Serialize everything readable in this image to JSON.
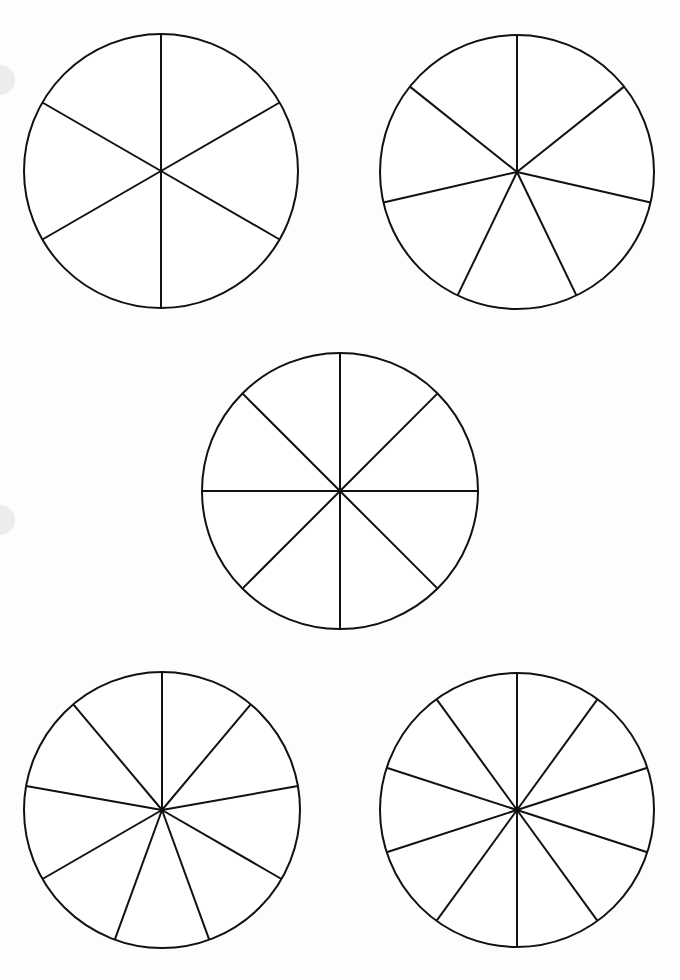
{
  "page": {
    "background": "#fdfdfd",
    "stroke_color": "#111111",
    "stroke_width": 2
  },
  "punch_holes": [
    {
      "x": 0,
      "y": 80,
      "r": 15
    },
    {
      "x": 0,
      "y": 520,
      "r": 15
    }
  ],
  "circles": [
    {
      "name": "circle-6-sectors",
      "cx": 161,
      "cy": 171,
      "r": 137,
      "sectors": 6
    },
    {
      "name": "circle-7-sectors",
      "cx": 517,
      "cy": 172,
      "r": 137,
      "sectors": 7
    },
    {
      "name": "circle-8-sectors",
      "cx": 340,
      "cy": 491,
      "r": 138,
      "sectors": 8
    },
    {
      "name": "circle-9-sectors",
      "cx": 162,
      "cy": 810,
      "r": 138,
      "sectors": 9
    },
    {
      "name": "circle-10-sectors",
      "cx": 517,
      "cy": 810,
      "r": 137,
      "sectors": 10
    }
  ]
}
